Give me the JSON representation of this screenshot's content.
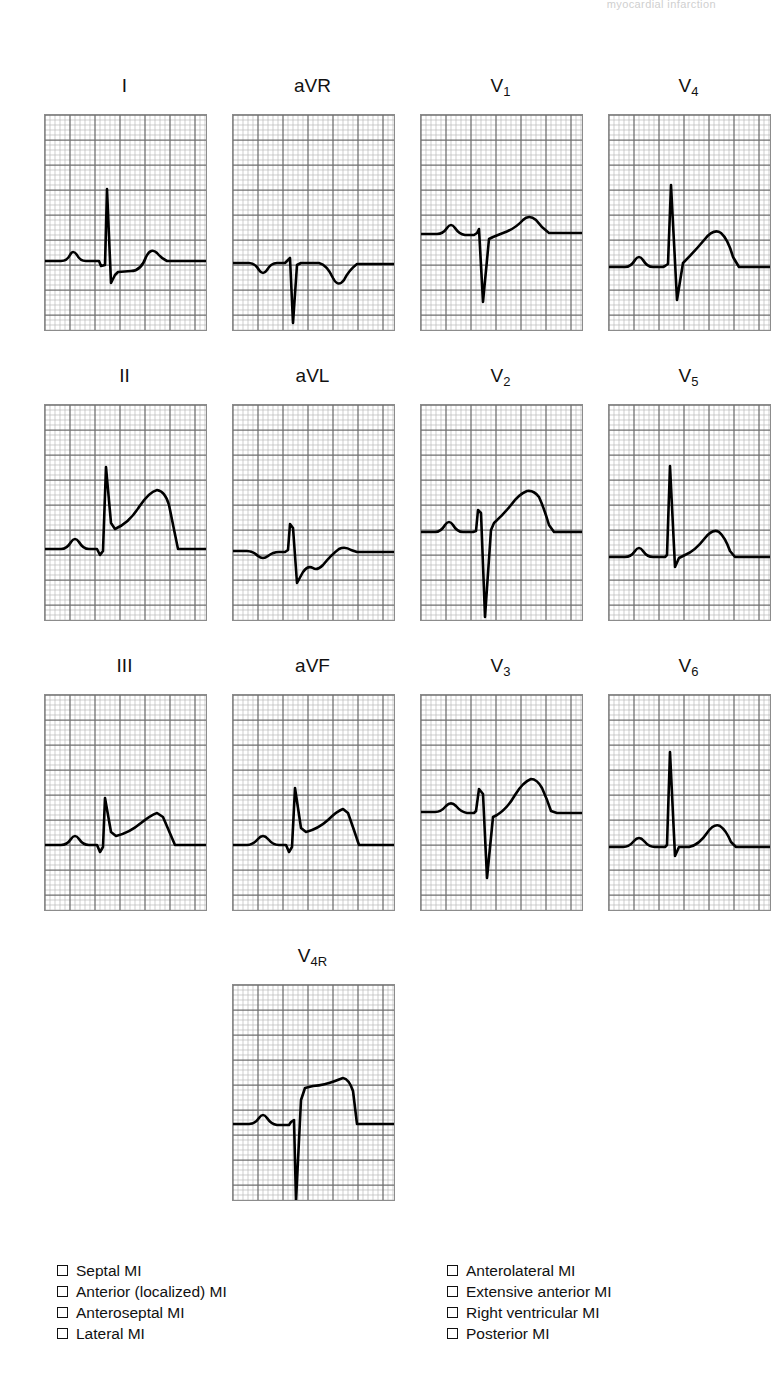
{
  "document": {
    "running_head": "myocardial infarction",
    "page_type": "12-lead ECG worksheet with diagnosis checklist"
  },
  "grid": {
    "small_square_px": 5,
    "heavy_every": 5,
    "fine_color": "#b9b9b9",
    "bold_color": "#6f6f6f",
    "border_color": "#8c8c8c",
    "trace_color": "#000000",
    "panel_width_px": 161,
    "panel_height_px": 215
  },
  "leads": [
    {
      "id": "I",
      "label": "I",
      "sub": "",
      "row": 0,
      "col": 0,
      "desc": "normal P, tall narrow R with deep S, flat ST, small upright T",
      "baseline_y": 146,
      "path": "M0,146 L16,146 Q22,146 25,140 Q28,134 32,140 Q35,146 41,146 L54,146 L56,151 L60,150 L62,74 L66,168 L70,160 L73,157 L86,156 Q96,156 101,142 Q106,132 112,138 Q116,143 122,146 L161,146"
    },
    {
      "id": "aVR",
      "label": "aVR",
      "sub": "",
      "row": 0,
      "col": 1,
      "desc": "inverted P, deep QS complex, inverted T wave",
      "baseline_y": 148,
      "path": "M0,148 L16,148 Q22,148 26,155 Q30,161 34,155 Q38,148 44,148 L52,148 L54,146 L57,143 L60,208 L64,150 L68,148 L86,148 Q94,150 100,163 Q105,173 111,165 Q116,155 124,149 L161,149"
    },
    {
      "id": "V1",
      "label": "V",
      "sub": "1",
      "row": 0,
      "col": 2,
      "desc": "small P, deep QS complex, slight ST elevation, upright T",
      "baseline_y": 119,
      "path": "M0,119 L16,119 Q22,119 26,113 Q30,107 34,113 Q38,119 44,120 L53,120 L56,118 L58,114 L62,187 L68,124 L72,122 L82,118 Q94,114 102,105 Q108,99 115,105 Q120,112 128,118 L161,118"
    },
    {
      "id": "V4",
      "label": "V",
      "sub": "4",
      "row": 0,
      "col": 3,
      "desc": "small P, tall R with deep S, convex ST elevation, large upright T",
      "baseline_y": 152,
      "path": "M0,152 L16,152 Q22,152 26,145 Q30,139 34,145 Q38,152 44,152 L54,152 L56,151 L59,149 L62,70 L68,185 L74,148 Q86,136 96,124 Q105,113 112,118 Q119,124 124,142 L130,152 L161,152"
    },
    {
      "id": "II",
      "label": "II",
      "sub": "",
      "row": 1,
      "col": 0,
      "desc": "upright P, tall R, ST elevation, very large T wave",
      "baseline_y": 144,
      "path": "M0,144 L16,144 Q22,144 26,137 Q30,131 34,137 Q38,144 44,144 L52,144 L55,150 L58,146 L61,62 L66,118 L70,124 Q84,118 94,102 Q104,87 112,85 Q120,86 124,100 Q128,120 133,144 L161,144"
    },
    {
      "id": "aVL",
      "label": "aVL",
      "sub": "",
      "row": 1,
      "col": 1,
      "desc": "flat P, small r then deep S, biphasic/inverted T",
      "baseline_y": 146,
      "path": "M0,146 L14,146 Q20,146 25,151 Q30,155 35,151 Q40,147 46,147 L52,147 L55,145 L57,119 L60,123 L64,178 L70,167 Q75,160 80,163 Q84,166 90,160 Q98,150 106,144 Q112,141 118,145 L124,147 L161,147"
    },
    {
      "id": "V2",
      "label": "V",
      "sub": "2",
      "row": 1,
      "col": 2,
      "desc": "small P, very deep S, marked ST elevation, very large T wave",
      "baseline_y": 127,
      "path": "M0,127 L14,127 Q20,127 24,120 Q28,114 32,120 Q36,127 42,127 L52,127 L55,126 L57,105 L60,108 L64,212 L70,125 L73,118 Q82,110 90,100 Q98,89 106,86 Q113,85 118,92 Q123,103 128,120 L133,127 L161,127"
    },
    {
      "id": "V5",
      "label": "V",
      "sub": "5",
      "row": 1,
      "col": 3,
      "desc": "small P, very tall narrow R, small S, slight ST elevation, upright T",
      "baseline_y": 152,
      "path": "M0,152 L16,152 Q22,152 26,146 Q30,140 34,146 Q38,152 44,152 L56,152 L58,150 L61,61 L66,162 L70,153 L76,150 Q86,146 96,133 Q104,123 110,127 Q116,132 121,146 L126,152 L161,152"
    },
    {
      "id": "III",
      "label": "III",
      "sub": "",
      "row": 2,
      "col": 0,
      "desc": "small P, tall R, ST elevation with upsloping segment, T merges into ST",
      "baseline_y": 150,
      "path": "M0,150 L16,150 Q22,150 26,144 Q30,138 34,144 Q38,150 44,150 L52,150 L55,157 L58,152 L60,103 L66,137 L71,141 Q84,138 96,128 Q106,120 112,118 L118,122 Q124,136 130,150 L161,150"
    },
    {
      "id": "aVF",
      "label": "aVF",
      "sub": "",
      "row": 2,
      "col": 1,
      "desc": "small P, tall R, ST elevation, broad T wave",
      "baseline_y": 150,
      "path": "M0,150 L14,150 Q20,150 25,144 Q30,138 35,144 Q40,150 46,150 L53,150 L56,157 L59,152 L62,93 L68,133 L73,137 Q85,134 95,125 Q104,116 110,114 L115,118 Q120,132 126,150 L161,150"
    },
    {
      "id": "V3",
      "label": "V",
      "sub": "3",
      "row": 2,
      "col": 2,
      "desc": "small P, small r then deep S, ST elevation, large upright T",
      "baseline_y": 117,
      "path": "M0,117 L14,117 Q20,117 25,111 Q30,106 35,111 Q40,117 46,118 L53,118 L55,116 L58,94 L62,99 L66,183 L72,122 L76,120 Q86,114 94,100 Q102,87 110,84 Q116,84 121,93 Q126,104 130,116 L136,118 L161,118"
    },
    {
      "id": "V6",
      "label": "V",
      "sub": "6",
      "row": 2,
      "col": 3,
      "desc": "small P, tall narrow R, small s, upright T wave",
      "baseline_y": 152,
      "path": "M0,152 L14,152 Q20,152 25,146 Q30,140 35,146 Q40,152 46,152 L56,152 L58,150 L61,57 L66,161 L70,152 L80,152 Q90,150 98,138 Q105,128 111,131 Q117,135 122,147 L127,152 L161,152"
    },
    {
      "id": "V4R",
      "label": "V",
      "sub": "4R",
      "row": 3,
      "col": 1,
      "desc": "small P, deep QS complex, marked ST elevation with plateau",
      "baseline_y": 139,
      "path": "M0,139 L16,139 Q22,139 26,133 Q30,127 34,133 Q38,139 44,140 L56,140 L58,137 L61,135 L63,216 L68,115 L72,103 L80,101 Q92,100 102,96 L110,93 Q116,94 120,106 L124,139 L161,139"
    }
  ],
  "checklist": {
    "left_column": [
      {
        "label": "Septal MI",
        "checked": false
      },
      {
        "label": "Anterior (localized) MI",
        "checked": false
      },
      {
        "label": "Anteroseptal MI",
        "checked": false
      },
      {
        "label": "Lateral MI",
        "checked": false
      }
    ],
    "right_column": [
      {
        "label": "Anterolateral MI",
        "checked": false
      },
      {
        "label": "Extensive anterior MI",
        "checked": false
      },
      {
        "label": "Right ventricular MI",
        "checked": false
      },
      {
        "label": "Posterior MI",
        "checked": false
      }
    ]
  }
}
